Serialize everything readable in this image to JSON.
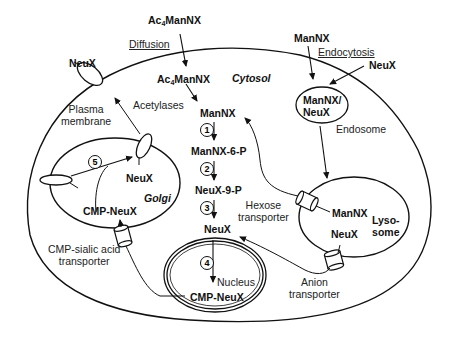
{
  "diagram": {
    "compartments": {
      "cytosol": "Cytosol",
      "golgi": "Golgi",
      "nucleus": "Nucleus",
      "endosome": "Endosome",
      "lysosome_line1": "Lyso-",
      "lysosome_line2": "some",
      "plasma_membrane_line1": "Plasma",
      "plasma_membrane_line2": "membrane"
    },
    "outside": {
      "ac4mannx_prefix": "Ac",
      "ac4mannx_sub": "4",
      "ac4mannx_suffix": "ManNX",
      "diffusion": "Diffusion",
      "mannx": "ManNX",
      "endocytosis": "Endocytosis",
      "neux_right": "NeuX",
      "neux_left": "NeuX"
    },
    "pathway": {
      "ac4mannx_prefix": "Ac",
      "ac4mannx_sub": "4",
      "ac4mannx_suffix": "ManNX",
      "acetylases": "Acetylases",
      "mannx": "ManNX",
      "mannx_6p": "ManNX-6-P",
      "neux_9p": "NeuX-9-P",
      "neux": "NeuX",
      "cmp_neux_nucleus": "CMP-NeuX",
      "steps": [
        "1",
        "2",
        "3",
        "4",
        "5"
      ]
    },
    "endosome_content_line1": "ManNX/",
    "endosome_content_line2": "NeuX",
    "lysosome": {
      "mannx": "ManNX",
      "neux": "NeuX"
    },
    "golgi": {
      "neux": "NeuX",
      "cmp_neux": "CMP-NeuX"
    },
    "transporters": {
      "hexose_line1": "Hexose",
      "hexose_line2": "transporter",
      "anion_line1": "Anion",
      "anion_line2": "transporter",
      "cmp_sialic_line1": "CMP-sialic acid",
      "cmp_sialic_line2": "transporter"
    }
  }
}
